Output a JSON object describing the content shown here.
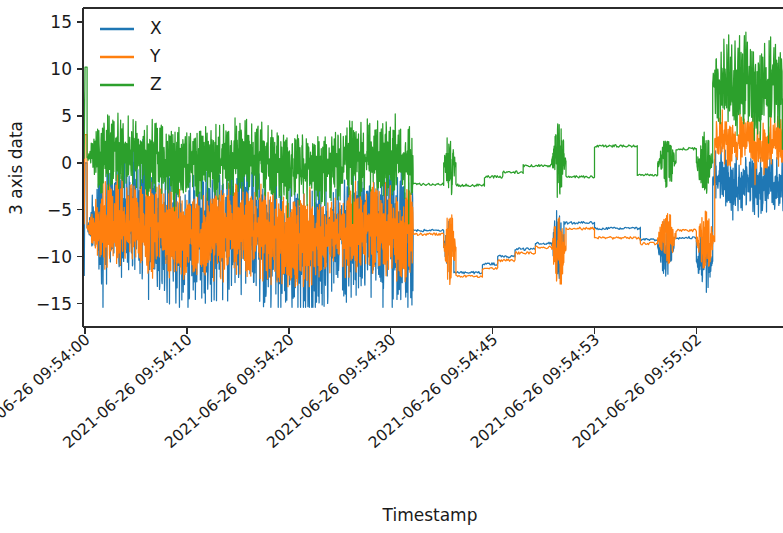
{
  "chart_data": {
    "type": "line",
    "title": "",
    "xlabel": "Timestamp",
    "ylabel": "3 axis data",
    "ylim": [
      -17.5,
      16.5
    ],
    "yticks": [
      15,
      10,
      5,
      0,
      -5,
      -10,
      -15
    ],
    "ytick_labels": [
      "15",
      "10",
      "5",
      "0",
      "−5",
      "−10",
      "−15"
    ],
    "xtick_labels": [
      "2021-06-26 09:54:00",
      "2021-06-26 09:54:10",
      "2021-06-26 09:54:20",
      "2021-06-26 09:54:30",
      "2021-06-26 09:54:45",
      "2021-06-26 09:54:53",
      "2021-06-26 09:55:02"
    ],
    "xtick_positions": [
      0,
      1,
      2,
      3,
      4,
      5,
      6
    ],
    "xlim": [
      -0.02,
      6.85
    ],
    "grid": false,
    "legend_position": "upper left",
    "colors": {
      "X": "#1f77b4",
      "Y": "#ff7f0e",
      "Z": "#2ca02c",
      "axis": "#2b2b2b",
      "text": "#1a1a1a",
      "background": "#ffffff"
    },
    "series": [
      {
        "name": "X",
        "color": "#1f77b4",
        "baseline_segments": [
          {
            "from": 0.0,
            "to": 0.02,
            "level": 0.0,
            "mode": "spike"
          },
          {
            "from": 0.02,
            "to": 3.22,
            "level": -7.6,
            "mode": "oscillate",
            "amp": 6.2,
            "freq": 165
          },
          {
            "from": 3.22,
            "to": 3.52,
            "level": -7.2,
            "mode": "plateau"
          },
          {
            "from": 3.52,
            "to": 3.62,
            "level": -9.0,
            "mode": "burst",
            "amp": 3.8
          },
          {
            "from": 3.62,
            "to": 3.9,
            "level": -11.7,
            "mode": "plateau"
          },
          {
            "from": 3.9,
            "to": 4.05,
            "level": -10.8,
            "mode": "plateau"
          },
          {
            "from": 4.05,
            "to": 4.22,
            "level": -10.0,
            "mode": "plateau"
          },
          {
            "from": 4.22,
            "to": 4.42,
            "level": -9.2,
            "mode": "plateau"
          },
          {
            "from": 4.42,
            "to": 4.58,
            "level": -8.6,
            "mode": "plateau"
          },
          {
            "from": 4.58,
            "to": 4.7,
            "level": -8.8,
            "mode": "burst",
            "amp": 4.0
          },
          {
            "from": 4.7,
            "to": 5.0,
            "level": -6.4,
            "mode": "plateau"
          },
          {
            "from": 5.0,
            "to": 5.45,
            "level": -7.0,
            "mode": "plateau"
          },
          {
            "from": 5.45,
            "to": 5.62,
            "level": -8.2,
            "mode": "plateau"
          },
          {
            "from": 5.62,
            "to": 5.78,
            "level": -9.0,
            "mode": "burst",
            "amp": 3.2
          },
          {
            "from": 5.78,
            "to": 6.0,
            "level": -8.0,
            "mode": "plateau"
          },
          {
            "from": 6.0,
            "to": 6.16,
            "level": -10.5,
            "mode": "burst",
            "amp": 3.6
          },
          {
            "from": 6.16,
            "to": 6.85,
            "level": -2.0,
            "mode": "oscillate",
            "amp": 2.6,
            "freq": 150
          }
        ],
        "initial_spike": [
          1.5,
          -3.0,
          -9.5,
          -12.0
        ],
        "min": -15.4,
        "max": 2.5
      },
      {
        "name": "Y",
        "color": "#ff7f0e",
        "baseline_segments": [
          {
            "from": 0.0,
            "to": 0.02,
            "level": 3.0,
            "mode": "spike"
          },
          {
            "from": 0.02,
            "to": 3.22,
            "level": -7.4,
            "mode": "oscillate",
            "amp": 4.2,
            "freq": 170
          },
          {
            "from": 3.22,
            "to": 3.52,
            "level": -7.6,
            "mode": "plateau"
          },
          {
            "from": 3.52,
            "to": 3.64,
            "level": -9.0,
            "mode": "burst",
            "amp": 4.2
          },
          {
            "from": 3.64,
            "to": 3.9,
            "level": -12.1,
            "mode": "plateau"
          },
          {
            "from": 3.9,
            "to": 4.05,
            "level": -11.3,
            "mode": "plateau"
          },
          {
            "from": 4.05,
            "to": 4.22,
            "level": -10.4,
            "mode": "plateau"
          },
          {
            "from": 4.22,
            "to": 4.42,
            "level": -9.6,
            "mode": "plateau"
          },
          {
            "from": 4.42,
            "to": 4.58,
            "level": -9.0,
            "mode": "plateau"
          },
          {
            "from": 4.58,
            "to": 4.72,
            "level": -9.2,
            "mode": "burst",
            "amp": 4.4
          },
          {
            "from": 4.72,
            "to": 5.0,
            "level": -7.0,
            "mode": "plateau"
          },
          {
            "from": 5.0,
            "to": 5.45,
            "level": -8.0,
            "mode": "plateau"
          },
          {
            "from": 5.45,
            "to": 5.62,
            "level": -8.6,
            "mode": "plateau"
          },
          {
            "from": 5.62,
            "to": 5.8,
            "level": -8.0,
            "mode": "burst",
            "amp": 3.0
          },
          {
            "from": 5.8,
            "to": 6.0,
            "level": -7.2,
            "mode": "plateau"
          },
          {
            "from": 6.0,
            "to": 6.18,
            "level": -8.4,
            "mode": "burst",
            "amp": 3.4
          },
          {
            "from": 6.18,
            "to": 6.85,
            "level": 2.2,
            "mode": "oscillate",
            "amp": 2.4,
            "freq": 140
          }
        ],
        "initial_spike": [
          9.8,
          4.0,
          -2.0,
          -6.5
        ],
        "min": -13.2,
        "max": 9.8
      },
      {
        "name": "Z",
        "color": "#2ca02c",
        "baseline_segments": [
          {
            "from": 0.0,
            "to": 0.02,
            "level": 10.2,
            "mode": "spike"
          },
          {
            "from": 0.02,
            "to": 3.22,
            "level": 0.2,
            "mode": "oscillate",
            "amp": 3.4,
            "freq": 160
          },
          {
            "from": 3.22,
            "to": 3.52,
            "level": -2.3,
            "mode": "plateau"
          },
          {
            "from": 3.52,
            "to": 3.64,
            "level": 0.0,
            "mode": "burst",
            "amp": 3.8
          },
          {
            "from": 3.64,
            "to": 3.92,
            "level": -2.4,
            "mode": "plateau"
          },
          {
            "from": 3.92,
            "to": 4.1,
            "level": -1.5,
            "mode": "plateau"
          },
          {
            "from": 4.1,
            "to": 4.3,
            "level": -1.0,
            "mode": "plateau"
          },
          {
            "from": 4.3,
            "to": 4.58,
            "level": -0.3,
            "mode": "plateau"
          },
          {
            "from": 4.58,
            "to": 4.72,
            "level": 0.2,
            "mode": "burst",
            "amp": 4.2
          },
          {
            "from": 4.72,
            "to": 5.0,
            "level": -1.5,
            "mode": "plateau"
          },
          {
            "from": 5.0,
            "to": 5.42,
            "level": 1.8,
            "mode": "plateau"
          },
          {
            "from": 5.42,
            "to": 5.62,
            "level": -1.3,
            "mode": "plateau"
          },
          {
            "from": 5.62,
            "to": 5.8,
            "level": 0.0,
            "mode": "burst",
            "amp": 3.0
          },
          {
            "from": 5.8,
            "to": 6.0,
            "level": 1.5,
            "mode": "plateau"
          },
          {
            "from": 6.0,
            "to": 6.16,
            "level": 0.0,
            "mode": "burst",
            "amp": 3.6
          },
          {
            "from": 6.16,
            "to": 6.85,
            "level": 8.0,
            "mode": "oscillate",
            "amp": 4.6,
            "freq": 130
          }
        ],
        "initial_spike": [
          10.2,
          7.5,
          3.0,
          0.5
        ],
        "min": -6.5,
        "max": 14.0
      }
    ]
  },
  "legend": {
    "entries": [
      {
        "label": "X",
        "color": "#1f77b4"
      },
      {
        "label": "Y",
        "color": "#ff7f0e"
      },
      {
        "label": "Z",
        "color": "#2ca02c"
      }
    ]
  },
  "axes": {
    "ylabel": "3 axis data",
    "xlabel": "Timestamp"
  }
}
